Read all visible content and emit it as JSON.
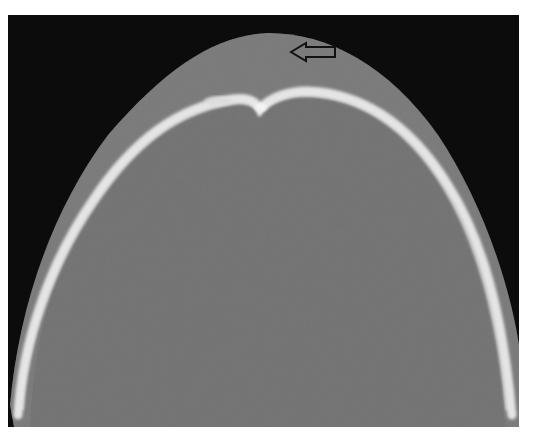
{
  "figure": {
    "description": "Axial CT scan (bone window) of the skull vertex showing the calvarium",
    "modality": "CT",
    "window": "bone",
    "annotation": {
      "type": "arrow",
      "icon": "arrow-left-icon",
      "direction": "left",
      "style": "black outline, unfilled"
    }
  },
  "colors": {
    "background": "#0c0c0c",
    "soft_tissue": "#7a7a7a",
    "brain": "#737373",
    "bone": "#e6e6e6",
    "arrow_stroke": "#111111"
  }
}
